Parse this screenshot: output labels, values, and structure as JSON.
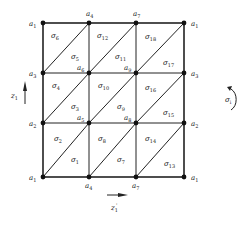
{
  "diagram": {
    "type": "triangulated-grid",
    "grid": {
      "x": [
        43,
        89,
        136,
        184
      ],
      "y": [
        23,
        73,
        123,
        177
      ]
    },
    "vertices": [
      {
        "row": 0,
        "col": 0,
        "base": "a",
        "sub": "1"
      },
      {
        "row": 0,
        "col": 1,
        "base": "a",
        "sub": "4"
      },
      {
        "row": 0,
        "col": 2,
        "base": "a",
        "sub": "7"
      },
      {
        "row": 0,
        "col": 3,
        "base": "a",
        "sub": "1"
      },
      {
        "row": 1,
        "col": 0,
        "base": "a",
        "sub": "3"
      },
      {
        "row": 1,
        "col": 1,
        "base": "a",
        "sub": "6"
      },
      {
        "row": 1,
        "col": 2,
        "base": "a",
        "sub": "9"
      },
      {
        "row": 1,
        "col": 3,
        "base": "a",
        "sub": "3"
      },
      {
        "row": 2,
        "col": 0,
        "base": "a",
        "sub": "2"
      },
      {
        "row": 2,
        "col": 1,
        "base": "a",
        "sub": "5"
      },
      {
        "row": 2,
        "col": 2,
        "base": "a",
        "sub": "8"
      },
      {
        "row": 2,
        "col": 3,
        "base": "a",
        "sub": "2"
      },
      {
        "row": 3,
        "col": 0,
        "base": "a",
        "sub": "1"
      },
      {
        "row": 3,
        "col": 1,
        "base": "a",
        "sub": "4"
      },
      {
        "row": 3,
        "col": 2,
        "base": "a",
        "sub": "7"
      },
      {
        "row": 3,
        "col": 3,
        "base": "a",
        "sub": "1"
      }
    ],
    "triangles": [
      {
        "base": "σ",
        "sub": "1",
        "cx": 74,
        "cy": 160
      },
      {
        "base": "σ",
        "sub": "2",
        "cx": 58,
        "cy": 139
      },
      {
        "base": "σ",
        "sub": "3",
        "cx": 74,
        "cy": 107
      },
      {
        "base": "σ",
        "sub": "4",
        "cx": 55,
        "cy": 86
      },
      {
        "base": "σ",
        "sub": "5",
        "cx": 74,
        "cy": 57
      },
      {
        "base": "σ",
        "sub": "6",
        "cx": 55,
        "cy": 37
      },
      {
        "base": "σ",
        "sub": "7",
        "cx": 121,
        "cy": 160
      },
      {
        "base": "σ",
        "sub": "8",
        "cx": 101,
        "cy": 139
      },
      {
        "base": "σ",
        "sub": "9",
        "cx": 121,
        "cy": 107
      },
      {
        "base": "σ",
        "sub": "10",
        "cx": 103,
        "cy": 86
      },
      {
        "base": "σ",
        "sub": "11",
        "cx": 120,
        "cy": 57
      },
      {
        "base": "σ",
        "sub": "12",
        "cx": 103,
        "cy": 36
      },
      {
        "base": "σ",
        "sub": "13",
        "cx": 169,
        "cy": 164
      },
      {
        "base": "σ",
        "sub": "14",
        "cx": 150,
        "cy": 139
      },
      {
        "base": "σ",
        "sub": "15",
        "cx": 168,
        "cy": 113
      },
      {
        "base": "σ",
        "sub": "16",
        "cx": 150,
        "cy": 88
      },
      {
        "base": "σ",
        "sub": "17",
        "cx": 168,
        "cy": 63
      },
      {
        "base": "σ",
        "sub": "18",
        "cx": 150,
        "cy": 37
      }
    ],
    "axes": {
      "vertical": {
        "base": "z",
        "sub": "1",
        "label": "z1"
      },
      "horizontal": {
        "base": "z",
        "sub": "1",
        "sup": "'",
        "label": "z'1"
      }
    },
    "orientation": {
      "base": "σ",
      "sub": "i",
      "label": "σi",
      "direction": "counterclockwise"
    },
    "colors": {
      "line": "#222222",
      "vertex": "#111111",
      "background": "#ffffff"
    }
  }
}
